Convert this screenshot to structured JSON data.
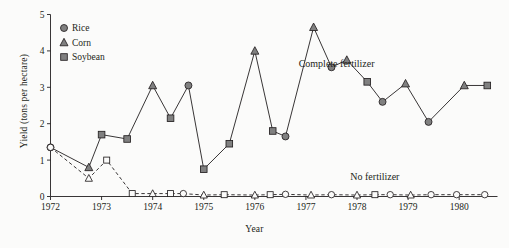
{
  "figure": {
    "background_color": "#fbfbfa",
    "ink_color": "#231f20",
    "marker_fill": "#808080",
    "marker_open_fill": "#fbfbfa"
  },
  "chart_data": {
    "type": "line",
    "title": "",
    "xlabel": "Year",
    "ylabel": "Yield (tons per hectare)",
    "xlim": [
      1972,
      1980.75
    ],
    "ylim": [
      0,
      5
    ],
    "yticks": [
      0,
      1,
      2,
      3,
      4,
      5
    ],
    "xticks": [
      1972,
      1973,
      1974,
      1975,
      1976,
      1977,
      1978,
      1979,
      1980
    ],
    "grid": false,
    "legend_position": "top-left",
    "legend": [
      {
        "label": "Rice",
        "marker": "circle"
      },
      {
        "label": "Corn",
        "marker": "triangle"
      },
      {
        "label": "Soybean",
        "marker": "square"
      }
    ],
    "annotations": [
      {
        "text": "Complete fertilizer",
        "x": 1977.6,
        "y": 3.55
      },
      {
        "text": "No fertilizer",
        "x": 1978.35,
        "y": 0.45
      }
    ],
    "series": [
      {
        "name": "Complete fertilizer",
        "line_style": "solid",
        "marker_style": "filled",
        "points": [
          {
            "x": 1972.0,
            "y": 1.35,
            "crop": "Rice"
          },
          {
            "x": 1972.75,
            "y": 0.8,
            "crop": "Corn"
          },
          {
            "x": 1973.0,
            "y": 1.7,
            "crop": "Soybean"
          },
          {
            "x": 1973.5,
            "y": 1.58,
            "crop": "Soybean"
          },
          {
            "x": 1974.0,
            "y": 3.05,
            "crop": "Corn"
          },
          {
            "x": 1974.35,
            "y": 2.15,
            "crop": "Soybean"
          },
          {
            "x": 1974.7,
            "y": 3.05,
            "crop": "Rice"
          },
          {
            "x": 1975.0,
            "y": 0.75,
            "crop": "Soybean"
          },
          {
            "x": 1975.5,
            "y": 1.45,
            "crop": "Soybean"
          },
          {
            "x": 1976.0,
            "y": 4.0,
            "crop": "Corn"
          },
          {
            "x": 1976.35,
            "y": 1.8,
            "crop": "Soybean"
          },
          {
            "x": 1976.6,
            "y": 1.65,
            "crop": "Rice"
          },
          {
            "x": 1977.15,
            "y": 4.65,
            "crop": "Corn"
          },
          {
            "x": 1977.5,
            "y": 3.55,
            "crop": "Rice"
          },
          {
            "x": 1977.8,
            "y": 3.75,
            "crop": "Corn"
          },
          {
            "x": 1978.2,
            "y": 3.15,
            "crop": "Soybean"
          },
          {
            "x": 1978.5,
            "y": 2.6,
            "crop": "Rice"
          },
          {
            "x": 1978.95,
            "y": 3.1,
            "crop": "Corn"
          },
          {
            "x": 1979.4,
            "y": 2.05,
            "crop": "Rice"
          },
          {
            "x": 1980.1,
            "y": 3.05,
            "crop": "Corn"
          },
          {
            "x": 1980.55,
            "y": 3.05,
            "crop": "Soybean"
          }
        ]
      },
      {
        "name": "No fertilizer",
        "line_style": "dashed",
        "marker_style": "open",
        "points": [
          {
            "x": 1972.0,
            "y": 1.35,
            "crop": "Rice"
          },
          {
            "x": 1972.75,
            "y": 0.5,
            "crop": "Corn"
          },
          {
            "x": 1973.1,
            "y": 1.0,
            "crop": "Soybean"
          },
          {
            "x": 1973.6,
            "y": 0.08,
            "crop": "Soybean"
          },
          {
            "x": 1974.0,
            "y": 0.08,
            "crop": "Corn"
          },
          {
            "x": 1974.35,
            "y": 0.08,
            "crop": "Soybean"
          },
          {
            "x": 1974.6,
            "y": 0.08,
            "crop": "Rice"
          },
          {
            "x": 1975.0,
            "y": 0.04,
            "crop": "Corn"
          },
          {
            "x": 1975.4,
            "y": 0.05,
            "crop": "Soybean"
          },
          {
            "x": 1976.0,
            "y": 0.04,
            "crop": "Corn"
          },
          {
            "x": 1976.3,
            "y": 0.05,
            "crop": "Soybean"
          },
          {
            "x": 1976.6,
            "y": 0.06,
            "crop": "Rice"
          },
          {
            "x": 1977.1,
            "y": 0.04,
            "crop": "Corn"
          },
          {
            "x": 1977.5,
            "y": 0.05,
            "crop": "Rice"
          },
          {
            "x": 1978.0,
            "y": 0.04,
            "crop": "Corn"
          },
          {
            "x": 1978.35,
            "y": 0.05,
            "crop": "Soybean"
          },
          {
            "x": 1978.65,
            "y": 0.05,
            "crop": "Rice"
          },
          {
            "x": 1979.05,
            "y": 0.04,
            "crop": "Corn"
          },
          {
            "x": 1979.45,
            "y": 0.05,
            "crop": "Rice"
          },
          {
            "x": 1979.95,
            "y": 0.05,
            "crop": "Rice"
          },
          {
            "x": 1980.5,
            "y": 0.05,
            "crop": "Rice"
          }
        ]
      }
    ]
  }
}
